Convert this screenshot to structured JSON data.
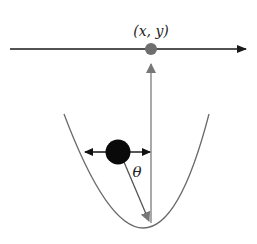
{
  "diagram": {
    "labels": {
      "point": "(x, y)",
      "angle": "θ"
    },
    "colors": {
      "axis": "#1a1a1a",
      "pivot_dot": "#6e6e6e",
      "vertical_arrow": "#7a7a7a",
      "parabola": "#6a6a6a",
      "ball": "#0a0a0a",
      "radius_arrow": "#555555"
    }
  }
}
